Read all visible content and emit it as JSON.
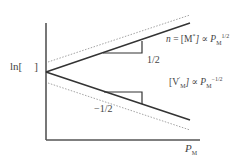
{
  "figure": {
    "y_axis_label": {
      "prefix": "ln",
      "bracket_open": "[",
      "bracket_close": "]"
    },
    "x_axis_label": {
      "main": "P",
      "sub": "M"
    },
    "upper_curve_label": {
      "lhs": "n",
      "eq": " = [M",
      "sup": "*",
      "rest": "] ∝ P",
      "sub": "M",
      "exp": "1/2"
    },
    "lower_curve_label": {
      "lhs": "[V",
      "sup": "'",
      "sub": "M",
      "rest": "] ∝ P",
      "sub2": "M",
      "exp": "−1/2"
    },
    "upper_slope_label": "1/2",
    "lower_slope_label": "−1/2"
  },
  "colors": {
    "axis": "#555555",
    "solid_line": "#333333",
    "dotted_line": "#999999",
    "text": "#444444"
  },
  "geometry": {
    "origin": [
      46,
      72
    ],
    "upper_solid_end": [
      190,
      23
    ],
    "lower_solid_end": [
      190,
      120
    ],
    "upper_dotted": [
      [
        46,
        62
      ],
      [
        190,
        15
      ]
    ],
    "lower_dotted": [
      [
        46,
        83
      ],
      [
        190,
        130
      ]
    ]
  }
}
